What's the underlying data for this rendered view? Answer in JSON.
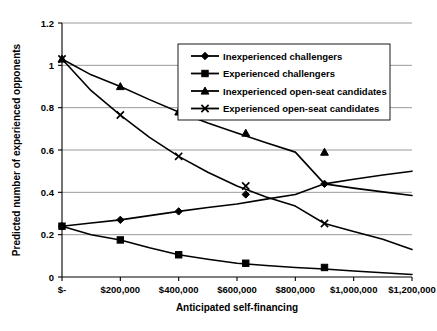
{
  "chart_data": {
    "type": "line",
    "title": "",
    "xlabel": "Anticipated self-financing",
    "ylabel": "Predicted number of experienced opponents",
    "xlim": [
      0,
      1200000
    ],
    "ylim": [
      0,
      1.2
    ],
    "grid": true,
    "legend_position": "top-right",
    "x_tick_labels": [
      "$-",
      "$200,000",
      "$400,000",
      "$600,000",
      "$800,000",
      "$1,000,000",
      "$1,200,000"
    ],
    "x_tick_values": [
      0,
      200000,
      400000,
      600000,
      800000,
      1000000,
      1200000
    ],
    "y_tick_labels": [
      "0",
      "0.2",
      "0.4",
      "0.6",
      "0.8",
      "1",
      "1.2"
    ],
    "y_tick_values": [
      0,
      0.2,
      0.4,
      0.6,
      0.8,
      1.0,
      1.2
    ],
    "x": [
      0,
      100000,
      200000,
      300000,
      400000,
      500000,
      600000,
      700000,
      800000,
      900000,
      1000000,
      1100000,
      1200000
    ],
    "marker_x": [
      0,
      200000,
      400000,
      630000,
      900000
    ],
    "series": [
      {
        "name": "Inexperienced challengers",
        "marker": "diamond",
        "values": [
          0.24,
          0.255,
          0.27,
          0.29,
          0.31,
          0.328,
          0.345,
          0.368,
          0.39,
          0.44,
          0.462,
          0.482,
          0.5
        ],
        "marker_values": [
          0.24,
          0.27,
          0.31,
          0.39,
          0.44
        ]
      },
      {
        "name": "Experienced challengers",
        "marker": "square",
        "values": [
          0.24,
          0.2,
          0.175,
          0.138,
          0.105,
          0.084,
          0.065,
          0.054,
          0.045,
          0.038,
          0.028,
          0.02,
          0.012
        ],
        "marker_values": [
          0.24,
          0.175,
          0.105,
          0.065,
          0.045
        ]
      },
      {
        "name": "Inexperienced open-seat candidates",
        "marker": "triangle",
        "values": [
          1.03,
          0.955,
          0.9,
          0.838,
          0.78,
          0.728,
          0.68,
          0.634,
          0.59,
          0.44,
          0.42,
          0.402,
          0.385
        ],
        "marker_values": [
          1.03,
          0.9,
          0.78,
          0.68,
          0.59
        ]
      },
      {
        "name": "Experienced open-seat candidates",
        "marker": "cross",
        "values": [
          1.03,
          0.88,
          0.765,
          0.66,
          0.57,
          0.495,
          0.43,
          0.378,
          0.335,
          0.253,
          0.215,
          0.178,
          0.13
        ],
        "marker_values": [
          1.03,
          0.765,
          0.57,
          0.43,
          0.253
        ]
      }
    ]
  }
}
